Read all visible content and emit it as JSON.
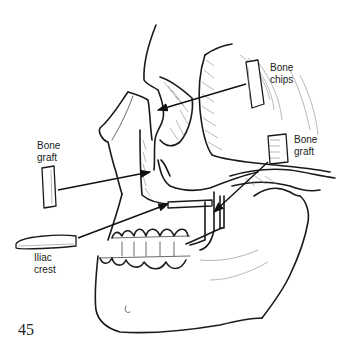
{
  "figure": {
    "number": "45"
  },
  "labels": {
    "bone_chips": [
      "Bone",
      "chips"
    ],
    "bone_graft_left": [
      "Bone",
      "graft"
    ],
    "bone_graft_right": [
      "Bone",
      "graft"
    ],
    "iliac_crest": [
      "Iliac",
      "crest"
    ]
  }
}
